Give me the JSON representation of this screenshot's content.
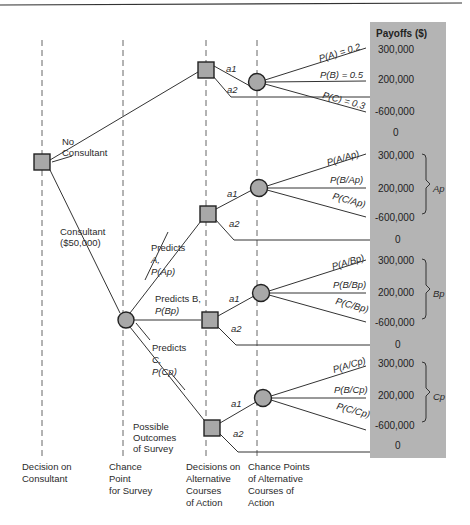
{
  "payoff_header": "Payoffs ($)",
  "branch_labels": {
    "no_consultant": [
      "No",
      "Consultant"
    ],
    "consultant": [
      "Consultant",
      "($50,000)"
    ],
    "predicts_a": [
      "Predicts",
      "A,",
      "P(Ap)"
    ],
    "predicts_b": [
      "Predicts B,",
      "P(Bp)"
    ],
    "predicts_c": [
      "Predicts",
      "C,",
      "P(Cp)"
    ],
    "possible_outcomes": [
      "Possible",
      "Outcomes",
      "of Survey"
    ],
    "a1": "a1",
    "a2": "a2"
  },
  "groups": [
    {
      "id": "no-consultant",
      "probs": [
        "P(A) = 0.2",
        "P(B) = 0.5",
        "P(C) = 0.3"
      ],
      "payoffs": [
        "300,000",
        "200,000",
        "-600,000"
      ],
      "a2_payoff": "0",
      "brace_label": ""
    },
    {
      "id": "predicts-a",
      "probs": [
        "P(A/Ap)",
        "P(B/Ap)",
        "P(C/Ap)"
      ],
      "payoffs": [
        "300,000",
        "200,000",
        "-600,000"
      ],
      "a2_payoff": "0",
      "brace_label": "Ap"
    },
    {
      "id": "predicts-b",
      "probs": [
        "P(A/Bp)",
        "P(B/Bp)",
        "P(C/Bp)"
      ],
      "payoffs": [
        "300,000",
        "200,000",
        "-600,000"
      ],
      "a2_payoff": "0",
      "brace_label": "Bp"
    },
    {
      "id": "predicts-c",
      "probs": [
        "P(A/Cp)",
        "P(B/Cp)",
        "P(C/Cp)"
      ],
      "payoffs": [
        "300,000",
        "200,000",
        "-600,000"
      ],
      "a2_payoff": "0",
      "brace_label": "Cp"
    }
  ],
  "column_labels": [
    [
      "Decision on",
      "Consultant"
    ],
    [
      "Chance",
      "Point",
      "for Survey"
    ],
    [
      "Decisions on",
      "Alternative",
      "Courses",
      "of Action"
    ],
    [
      "Chance Points",
      "of Alternative",
      "Courses of",
      "Action"
    ]
  ],
  "colors": {
    "node_fill": "#a8a8a8",
    "payoff_panel": "#b4b4b4",
    "line": "#333333"
  }
}
